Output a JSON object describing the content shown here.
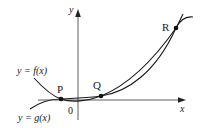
{
  "diagram": {
    "axes": {
      "x_label": "x",
      "y_label": "y",
      "origin_label": "0"
    },
    "curves": [
      {
        "name": "f",
        "label": "y = f(x)",
        "description": "parabola-like curve opening upward"
      },
      {
        "name": "g",
        "label": "y = g(x)",
        "description": "cubic-like curve"
      }
    ],
    "points": [
      {
        "label": "P",
        "description": "left intersection of f and g"
      },
      {
        "label": "Q",
        "description": "middle intersection of f and g"
      },
      {
        "label": "R",
        "description": "right intersection of f and g"
      }
    ],
    "colors": {
      "stroke": "#1a1a1a",
      "axis": "#333333",
      "background": "#ffffff"
    }
  }
}
